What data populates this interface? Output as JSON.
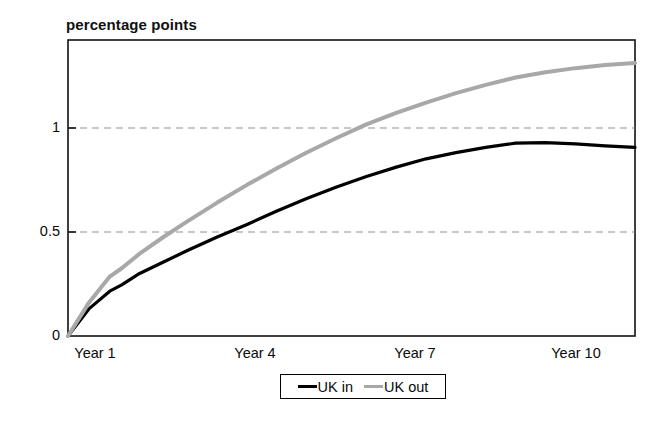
{
  "chart_data": {
    "type": "line",
    "title": "percentage points",
    "xlabel": "",
    "ylabel": "percentage points",
    "grid": true,
    "gridlines_y": [
      0.5,
      1
    ],
    "legend_position": "bottom-center",
    "xlim": [
      1,
      10.5
    ],
    "ylim": [
      0,
      1.42
    ],
    "xticks": [
      1,
      4,
      7,
      10
    ],
    "xtick_labels": [
      "Year 1",
      "Year 4",
      "Year 7",
      "Year 10"
    ],
    "yticks": [
      0,
      0.5,
      1
    ],
    "ytick_labels": [
      "0",
      "0.5",
      "1"
    ],
    "x": [
      1,
      1.35,
      1.7,
      1.9,
      2.2,
      2.6,
      3,
      3.5,
      4,
      4.5,
      5,
      5.5,
      6,
      6.5,
      7,
      7.5,
      8,
      8.5,
      9,
      9.5,
      10,
      10.5
    ],
    "series": [
      {
        "name": "UK in",
        "color": "#000000",
        "style": "solid",
        "values": [
          0,
          0.13,
          0.215,
          0.245,
          0.3,
          0.355,
          0.41,
          0.475,
          0.535,
          0.6,
          0.66,
          0.715,
          0.765,
          0.81,
          0.85,
          0.88,
          0.905,
          0.925,
          0.928,
          0.922,
          0.912,
          0.905
        ]
      },
      {
        "name": "UK out",
        "color": "#a8a8a8",
        "style": "solid",
        "values": [
          0,
          0.16,
          0.285,
          0.325,
          0.395,
          0.475,
          0.55,
          0.64,
          0.725,
          0.805,
          0.88,
          0.95,
          1.015,
          1.07,
          1.12,
          1.165,
          1.205,
          1.24,
          1.265,
          1.285,
          1.3,
          1.31
        ]
      }
    ]
  },
  "legend": {
    "items": [
      {
        "label": "UK in",
        "style": "solid"
      },
      {
        "label": "UK out",
        "style": "gray"
      }
    ]
  },
  "axes": {
    "y_tick_0": "0",
    "y_tick_05": "0.5",
    "y_tick_1": "1",
    "x_tick_1": "Year 1",
    "x_tick_4": "Year 4",
    "x_tick_7": "Year 7",
    "x_tick_10": "Year 10"
  }
}
